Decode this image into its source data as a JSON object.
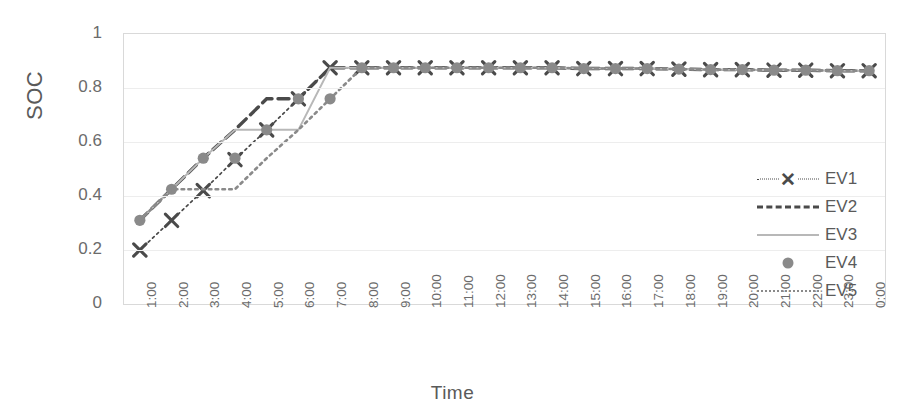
{
  "chart_data": {
    "type": "line",
    "title": "",
    "xlabel": "Time",
    "ylabel": "SOC",
    "ylim": [
      0,
      1
    ],
    "ytick_labels": [
      "1",
      "0.8",
      "0.6",
      "0.4",
      "0.2",
      "0"
    ],
    "ytick_values": [
      1,
      0.8,
      0.6,
      0.4,
      0.2,
      0
    ],
    "grid": "horizontal",
    "legend_position": "right-inside",
    "categories": [
      "1:00",
      "2:00",
      "3:00",
      "4:00",
      "5:00",
      "6:00",
      "7:00",
      "8:00",
      "9:00",
      "10:00",
      "11:00",
      "12:00",
      "13:00",
      "14:00",
      "15:00",
      "16:00",
      "17:00",
      "18:00",
      "19:00",
      "20:00",
      "21:00",
      "22:00",
      "23:00",
      "0:00"
    ],
    "series": [
      {
        "name": "EV1",
        "style": "dotted",
        "marker": "x",
        "color": "#4a4a4a",
        "values": [
          0.2,
          0.31,
          0.42,
          0.535,
          0.645,
          0.76,
          0.875,
          0.875,
          0.875,
          0.875,
          0.875,
          0.875,
          0.875,
          0.875,
          0.872,
          0.872,
          0.872,
          0.87,
          0.868,
          0.868,
          0.866,
          0.866,
          0.864,
          0.864
        ]
      },
      {
        "name": "EV2",
        "style": "dashed",
        "marker": "none",
        "color": "#4a4a4a",
        "values": [
          0.31,
          0.425,
          0.54,
          0.645,
          0.76,
          0.76,
          0.875,
          0.875,
          0.875,
          0.875,
          0.875,
          0.875,
          0.875,
          0.875,
          0.872,
          0.872,
          0.872,
          0.87,
          0.868,
          0.868,
          0.866,
          0.866,
          0.864,
          0.864
        ]
      },
      {
        "name": "EV3",
        "style": "solid",
        "marker": "none",
        "color": "#b8b8b8",
        "values": [
          0.31,
          0.425,
          0.54,
          0.645,
          0.645,
          0.645,
          0.875,
          0.875,
          0.875,
          0.875,
          0.875,
          0.875,
          0.875,
          0.875,
          0.872,
          0.872,
          0.872,
          0.87,
          0.868,
          0.868,
          0.866,
          0.866,
          0.864,
          0.864
        ]
      },
      {
        "name": "EV4",
        "style": "none",
        "marker": "circle",
        "color": "#8a8a8a",
        "values": [
          0.31,
          0.425,
          0.54,
          0.54,
          0.645,
          0.76,
          0.76,
          0.875,
          0.875,
          0.875,
          0.875,
          0.875,
          0.875,
          0.875,
          0.872,
          0.872,
          0.872,
          0.87,
          0.868,
          0.868,
          0.866,
          0.866,
          0.864,
          0.864
        ]
      },
      {
        "name": "EV5",
        "style": "dotted-fine",
        "marker": "none",
        "color": "#8a8a8a",
        "values": [
          0.31,
          0.425,
          0.425,
          0.425,
          0.54,
          0.645,
          0.76,
          0.875,
          0.875,
          0.875,
          0.875,
          0.875,
          0.875,
          0.875,
          0.872,
          0.872,
          0.872,
          0.87,
          0.868,
          0.868,
          0.866,
          0.866,
          0.864,
          0.864
        ]
      }
    ]
  },
  "legend": {
    "items": [
      {
        "label": "EV1",
        "key": "dotted-x-marker"
      },
      {
        "label": "EV2",
        "key": "dashed-line"
      },
      {
        "label": "EV3",
        "key": "solid-line"
      },
      {
        "label": "EV4",
        "key": "circle-marker"
      },
      {
        "label": "EV5",
        "key": "dotted-line"
      }
    ]
  },
  "colors": {
    "dark": "#4a4a4a",
    "mid": "#8a8a8a",
    "light": "#b8b8b8",
    "grid": "#ededed",
    "frame": "#d9d9d9",
    "text": "#5a5a5a"
  }
}
